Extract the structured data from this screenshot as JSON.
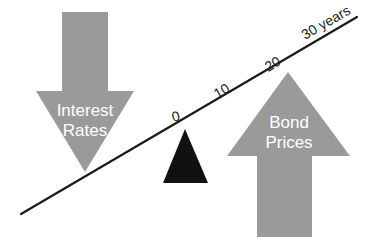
{
  "diagram": {
    "colors": {
      "arrow_gray": "#9a9a9a",
      "fulcrum_black": "#111111",
      "line_black": "#1a1a1a",
      "label_white": "#ffffff",
      "background": "#ffffff"
    },
    "down_arrow": {
      "name": "interest-rates-down-arrow",
      "label_line1": "Interest",
      "label_line2": "Rates",
      "direction": "down"
    },
    "up_arrow": {
      "name": "bond-prices-up-arrow",
      "label_line1": "Bond",
      "label_line2": "Prices",
      "direction": "up"
    },
    "fulcrum": {
      "name": "fulcrum-triangle"
    },
    "axis": {
      "ticks": [
        {
          "label": "0",
          "x": 177,
          "y": 121,
          "rotate": -15
        },
        {
          "label": "10",
          "x": 224,
          "y": 95,
          "rotate": -30
        },
        {
          "label": "20",
          "x": 275,
          "y": 68,
          "rotate": -30
        },
        {
          "label": "30 years",
          "x": 310,
          "y": 40,
          "rotate": -30
        }
      ]
    }
  }
}
